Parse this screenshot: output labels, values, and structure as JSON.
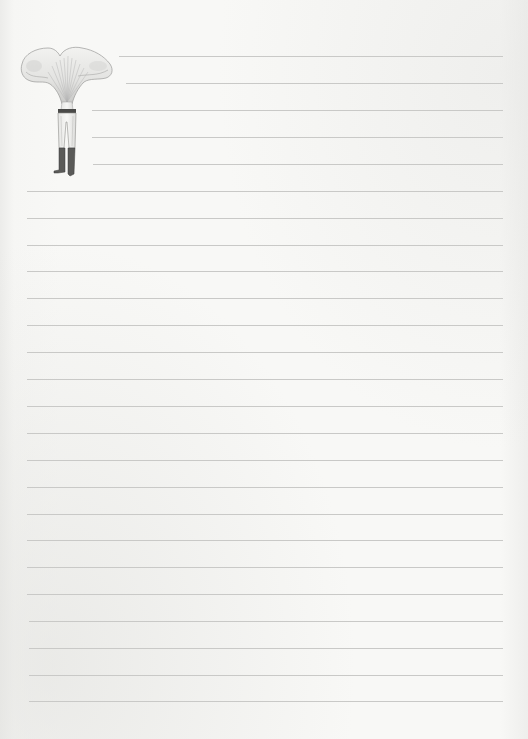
{
  "page": {
    "type": "lined-notepaper",
    "background_color": "#f8f8f6",
    "line_color": "#c9c9c7",
    "line_count": 25,
    "line_spacing_px": 26.9,
    "line_right_edge_px": 503
  },
  "illustration": {
    "subject": "figure with chanterelle mushroom head wearing trousers and boots",
    "position": "top-left"
  },
  "lines": [
    {
      "y": 56,
      "x_start": 119
    },
    {
      "y": 83,
      "x_start": 126
    },
    {
      "y": 110,
      "x_start": 92
    },
    {
      "y": 137,
      "x_start": 92
    },
    {
      "y": 164,
      "x_start": 93
    },
    {
      "y": 191,
      "x_start": 27
    },
    {
      "y": 218,
      "x_start": 27
    },
    {
      "y": 245,
      "x_start": 27
    },
    {
      "y": 271,
      "x_start": 27
    },
    {
      "y": 298,
      "x_start": 27
    },
    {
      "y": 325,
      "x_start": 27
    },
    {
      "y": 352,
      "x_start": 27
    },
    {
      "y": 379,
      "x_start": 27
    },
    {
      "y": 406,
      "x_start": 27
    },
    {
      "y": 433,
      "x_start": 27
    },
    {
      "y": 460,
      "x_start": 27
    },
    {
      "y": 487,
      "x_start": 27
    },
    {
      "y": 514,
      "x_start": 27
    },
    {
      "y": 540,
      "x_start": 27
    },
    {
      "y": 567,
      "x_start": 27
    },
    {
      "y": 594,
      "x_start": 27
    },
    {
      "y": 621,
      "x_start": 29
    },
    {
      "y": 648,
      "x_start": 29
    },
    {
      "y": 675,
      "x_start": 29
    },
    {
      "y": 701,
      "x_start": 29
    }
  ]
}
